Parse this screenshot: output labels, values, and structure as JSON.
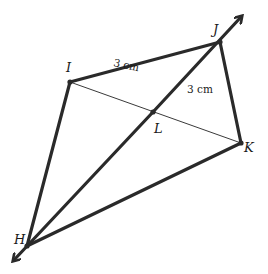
{
  "diagram": {
    "type": "kite-geometry",
    "points": {
      "H": {
        "label": "H",
        "x": 27,
        "y": 246
      },
      "I": {
        "label": "I",
        "x": 70,
        "y": 82
      },
      "J": {
        "label": "J",
        "x": 220,
        "y": 42
      },
      "K": {
        "label": "K",
        "x": 241,
        "y": 143
      },
      "L": {
        "label": "L",
        "x": 153,
        "y": 112
      }
    },
    "segments": [
      {
        "from": "H",
        "to": "I",
        "style": "thick"
      },
      {
        "from": "I",
        "to": "J",
        "style": "thick"
      },
      {
        "from": "J",
        "to": "K",
        "style": "thick"
      },
      {
        "from": "K",
        "to": "H",
        "style": "thick"
      },
      {
        "from": "I",
        "to": "K",
        "style": "thin"
      }
    ],
    "line": {
      "through": [
        "H",
        "J"
      ],
      "arrows": "both"
    },
    "measurements": {
      "IJ": "3 cm",
      "JL": "3 cm"
    },
    "colors": {
      "stroke": "#2a2a2a",
      "background": "#ffffff"
    }
  }
}
